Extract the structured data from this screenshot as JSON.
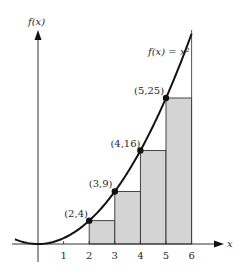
{
  "chart_data": {
    "type": "area",
    "title": "",
    "function_label": "f(x) = x²",
    "xlabel": "x",
    "ylabel": "f(x)",
    "x_ticks": [
      "1",
      "2",
      "3",
      "4",
      "5",
      "6"
    ],
    "xlim": [
      -1,
      6.5
    ],
    "ylim": [
      0,
      38
    ],
    "grid": false,
    "curve": {
      "expression": "x^2",
      "domain": [
        -0.9,
        6
      ]
    },
    "rectangles": [
      {
        "x_start": 2,
        "x_end": 3,
        "height": 4
      },
      {
        "x_start": 3,
        "x_end": 4,
        "height": 9
      },
      {
        "x_start": 4,
        "x_end": 5,
        "height": 16
      },
      {
        "x_start": 5,
        "x_end": 6,
        "height": 25
      }
    ],
    "points": [
      {
        "x": 2,
        "y": 4,
        "label": "(2,4)"
      },
      {
        "x": 3,
        "y": 9,
        "label": "(3,9)"
      },
      {
        "x": 4,
        "y": 16,
        "label": "(4,16)"
      },
      {
        "x": 5,
        "y": 25,
        "label": "(5,25)"
      }
    ],
    "colors": {
      "curve": "#111111",
      "rect_fill": "#d4d4d4",
      "rect_stroke": "#333333",
      "axis": "#333333"
    }
  }
}
